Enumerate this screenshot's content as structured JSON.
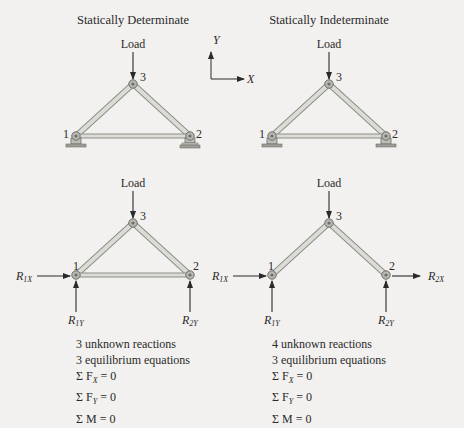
{
  "titles": {
    "left": "Statically Determinate",
    "right": "Statically Indeterminate"
  },
  "axes": {
    "y_label": "Y",
    "x_label": "X"
  },
  "load_label": "Load",
  "nodes": {
    "n1": "1",
    "n2": "2",
    "n3": "3"
  },
  "reactions": {
    "R1X": {
      "main": "R",
      "sub": "1X"
    },
    "R1Y": {
      "main": "R",
      "sub": "1Y"
    },
    "R2X": {
      "main": "R",
      "sub": "2X"
    },
    "R2Y": {
      "main": "R",
      "sub": "2Y"
    }
  },
  "determinate_notes": {
    "line1": "3 unknown reactions",
    "line2": "3 equilibrium equations",
    "eq1": "Σ F",
    "eq1_sub": "X",
    "eq1_rhs": " = 0",
    "eq2": "Σ F",
    "eq2_sub": "Y",
    "eq2_rhs": " = 0",
    "eq3": "Σ M",
    "eq3_rhs": " = 0"
  },
  "indeterminate_notes": {
    "line1": "4 unknown reactions",
    "line2": "3 equilibrium equations",
    "eq1": "Σ F",
    "eq1_sub": "X",
    "eq1_rhs": " = 0",
    "eq2": "Σ F",
    "eq2_sub": "Y",
    "eq2_rhs": " = 0",
    "eq3": "Σ M",
    "eq3_rhs": " = 0"
  },
  "colors": {
    "background": "#f2f1ef",
    "member_fill": "#d9d9d4",
    "member_edge": "#8e8e88",
    "ink": "#2a2a2a"
  }
}
